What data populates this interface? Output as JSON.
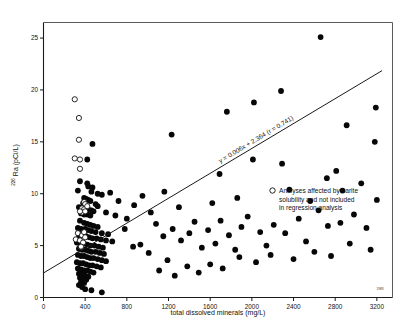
{
  "chart_data": {
    "type": "scatter",
    "title": "",
    "xlabel": "total dissolved minerals (mg/L)",
    "ylabel": "226 Ra (pCi/L)",
    "ylabel_super": "226",
    "ylabel_main": " Ra (pCi/L)",
    "xlim": [
      0,
      3350
    ],
    "ylim": [
      0,
      26.5
    ],
    "xticks": [
      0,
      400,
      800,
      1200,
      1600,
      2000,
      2400,
      2800,
      3200
    ],
    "xticklabels": [
      "0",
      "400",
      "800",
      "1200",
      "1600",
      "2000",
      "2400",
      "2800",
      "3200"
    ],
    "yticks": [
      0,
      5,
      10,
      15,
      20,
      25
    ],
    "yticklabels": [
      "0",
      "5",
      "10",
      "15",
      "20",
      "25"
    ],
    "grid": false,
    "legend_position": "right-middle",
    "annotations": [
      {
        "name": "regression-equation",
        "text": "y = 0.006x + 2.364 (r = 0.741)"
      },
      {
        "name": "corner-mark",
        "text": "1983"
      }
    ],
    "legend": [
      {
        "marker": "open-circle",
        "label_line_1": "Analyses affected by barite",
        "label_line_2": "solubility and not included",
        "label_line_3": "in regression analysis"
      }
    ],
    "regression": {
      "slope": 0.006,
      "intercept": 2.364,
      "r": 0.741,
      "x_start": 0,
      "x_end": 3250,
      "equation": "y = 0.006x + 2.364 (r = 0.741)"
    },
    "series": [
      {
        "name": "Analyses included in regression analysis",
        "marker": "filled-circle",
        "color": "#070707",
        "points": [
          [
            2660,
            25.1
          ],
          [
            2280,
            19.9
          ],
          [
            2020,
            18.8
          ],
          [
            3190,
            18.3
          ],
          [
            1760,
            17.9
          ],
          [
            1230,
            15.7
          ],
          [
            2910,
            16.6
          ],
          [
            3180,
            15.0
          ],
          [
            470,
            14.8
          ],
          [
            2010,
            13.3
          ],
          [
            2290,
            12.9
          ],
          [
            420,
            13.3
          ],
          [
            1690,
            11.9
          ],
          [
            2810,
            12.2
          ],
          [
            350,
            11.2
          ],
          [
            420,
            11.0
          ],
          [
            430,
            10.7
          ],
          [
            470,
            10.6
          ],
          [
            330,
            10.3
          ],
          [
            460,
            10.2
          ],
          [
            520,
            10.0
          ],
          [
            560,
            9.9
          ],
          [
            390,
            9.6
          ],
          [
            410,
            9.5
          ],
          [
            430,
            9.4
          ],
          [
            450,
            9.3
          ],
          [
            380,
            9.1
          ],
          [
            400,
            9.0
          ],
          [
            500,
            9.0
          ],
          [
            520,
            8.8
          ],
          [
            340,
            8.7
          ],
          [
            370,
            8.6
          ],
          [
            400,
            8.5
          ],
          [
            430,
            8.5
          ],
          [
            460,
            8.4
          ],
          [
            480,
            8.3
          ],
          [
            600,
            8.2
          ],
          [
            360,
            8.1
          ],
          [
            390,
            8.0
          ],
          [
            420,
            8.0
          ],
          [
            450,
            7.9
          ],
          [
            690,
            7.9
          ],
          [
            1300,
            8.7
          ],
          [
            1620,
            9.1
          ],
          [
            1860,
            9.6
          ],
          [
            2360,
            10.4
          ],
          [
            2560,
            9.3
          ],
          [
            3050,
            11.0
          ],
          [
            3200,
            9.4
          ],
          [
            800,
            7.6
          ],
          [
            350,
            7.4
          ],
          [
            390,
            7.2
          ],
          [
            420,
            7.1
          ],
          [
            450,
            7.0
          ],
          [
            480,
            6.9
          ],
          [
            520,
            6.8
          ],
          [
            330,
            6.7
          ],
          [
            360,
            6.6
          ],
          [
            400,
            6.6
          ],
          [
            430,
            6.5
          ],
          [
            460,
            6.4
          ],
          [
            500,
            6.3
          ],
          [
            560,
            6.2
          ],
          [
            620,
            6.1
          ],
          [
            340,
            6.0
          ],
          [
            380,
            6.0
          ],
          [
            410,
            5.9
          ],
          [
            440,
            5.8
          ],
          [
            470,
            5.7
          ],
          [
            510,
            5.7
          ],
          [
            550,
            5.6
          ],
          [
            600,
            5.5
          ],
          [
            660,
            5.4
          ],
          [
            320,
            5.3
          ],
          [
            350,
            5.2
          ],
          [
            390,
            5.2
          ],
          [
            420,
            5.1
          ],
          [
            450,
            5.0
          ],
          [
            490,
            5.0
          ],
          [
            530,
            4.9
          ],
          [
            570,
            4.8
          ],
          [
            340,
            4.7
          ],
          [
            370,
            4.6
          ],
          [
            400,
            4.6
          ],
          [
            430,
            4.5
          ],
          [
            460,
            4.4
          ],
          [
            500,
            4.4
          ],
          [
            540,
            4.3
          ],
          [
            580,
            4.2
          ],
          [
            330,
            4.1
          ],
          [
            360,
            4.0
          ],
          [
            390,
            4.0
          ],
          [
            420,
            3.9
          ],
          [
            450,
            3.8
          ],
          [
            480,
            3.8
          ],
          [
            520,
            3.7
          ],
          [
            560,
            3.6
          ],
          [
            600,
            3.5
          ],
          [
            320,
            3.4
          ],
          [
            350,
            3.3
          ],
          [
            380,
            3.3
          ],
          [
            410,
            3.2
          ],
          [
            440,
            3.1
          ],
          [
            470,
            3.1
          ],
          [
            510,
            3.0
          ],
          [
            550,
            2.9
          ],
          [
            330,
            2.8
          ],
          [
            360,
            2.7
          ],
          [
            390,
            2.6
          ],
          [
            420,
            2.6
          ],
          [
            450,
            2.5
          ],
          [
            480,
            2.4
          ],
          [
            340,
            2.3
          ],
          [
            370,
            2.2
          ],
          [
            400,
            2.1
          ],
          [
            430,
            2.0
          ],
          [
            350,
            1.9
          ],
          [
            380,
            1.8
          ],
          [
            410,
            1.7
          ],
          [
            360,
            1.5
          ],
          [
            390,
            1.4
          ],
          [
            340,
            1.2
          ],
          [
            370,
            1.0
          ],
          [
            400,
            0.8
          ],
          [
            460,
            0.7
          ],
          [
            560,
            0.5
          ],
          [
            780,
            6.6
          ],
          [
            860,
            4.9
          ],
          [
            930,
            5.1
          ],
          [
            1010,
            4.3
          ],
          [
            1080,
            7.1
          ],
          [
            1150,
            5.9
          ],
          [
            1190,
            3.6
          ],
          [
            1240,
            6.6
          ],
          [
            1320,
            5.5
          ],
          [
            1400,
            6.2
          ],
          [
            1450,
            7.3
          ],
          [
            1520,
            4.8
          ],
          [
            1580,
            6.5
          ],
          [
            1650,
            5.2
          ],
          [
            1700,
            7.4
          ],
          [
            1780,
            6.0
          ],
          [
            1840,
            4.6
          ],
          [
            1900,
            6.8
          ],
          [
            1960,
            7.8
          ],
          [
            2080,
            6.3
          ],
          [
            2140,
            5.0
          ],
          [
            2210,
            7.0
          ],
          [
            2320,
            6.2
          ],
          [
            2450,
            7.6
          ],
          [
            2520,
            5.4
          ],
          [
            2640,
            8.4
          ],
          [
            2730,
            6.9
          ],
          [
            2850,
            7.2
          ],
          [
            2980,
            8.0
          ],
          [
            3100,
            6.7
          ],
          [
            1110,
            2.6
          ],
          [
            1260,
            2.1
          ],
          [
            1380,
            3.0
          ],
          [
            1490,
            2.4
          ],
          [
            1600,
            3.2
          ],
          [
            1720,
            2.8
          ],
          [
            1880,
            3.9
          ],
          [
            2040,
            3.4
          ],
          [
            2180,
            4.1
          ],
          [
            2400,
            3.7
          ],
          [
            2600,
            4.4
          ],
          [
            2760,
            4.0
          ],
          [
            2940,
            5.2
          ],
          [
            3140,
            4.6
          ],
          [
            870,
            8.9
          ],
          [
            950,
            9.8
          ],
          [
            1030,
            8.2
          ],
          [
            1160,
            10.2
          ],
          [
            720,
            9.3
          ],
          [
            640,
            10.1
          ],
          [
            2720,
            11.5
          ],
          [
            2870,
            10.3
          ]
        ]
      },
      {
        "name": "Analyses affected by barite solubility",
        "marker": "open-circle",
        "color": "#ffffff",
        "points": [
          [
            300,
            19.1
          ],
          [
            340,
            17.3
          ],
          [
            340,
            15.2
          ],
          [
            300,
            13.4
          ],
          [
            350,
            13.3
          ],
          [
            350,
            12.4
          ],
          [
            390,
            9.2
          ],
          [
            400,
            9.0
          ],
          [
            370,
            8.6
          ],
          [
            390,
            8.5
          ],
          [
            370,
            8.2
          ],
          [
            350,
            8.3
          ],
          [
            420,
            8.8
          ],
          [
            400,
            8.3
          ],
          [
            330,
            6.2
          ],
          [
            370,
            6.0
          ],
          [
            390,
            6.3
          ],
          [
            310,
            5.6
          ],
          [
            350,
            5.5
          ],
          [
            380,
            5.3
          ],
          [
            360,
            4.9
          ],
          [
            400,
            5.8
          ]
        ]
      }
    ]
  }
}
